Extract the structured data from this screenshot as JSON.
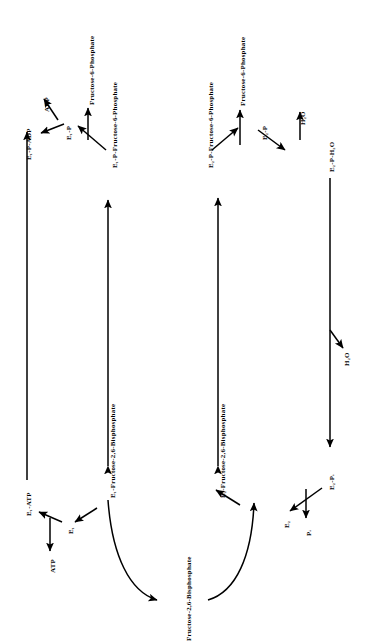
{
  "diagram": {
    "type": "reaction-scheme",
    "orientation": "text-rotated-90-ccw",
    "background_color": "#ffffff",
    "stroke_color": "#000000"
  },
  "nodes": {
    "e1_p_adp": {
      "label": "E₁-P-ADP",
      "branch": "left",
      "role": "complex"
    },
    "adp": {
      "label": "ADP",
      "branch": "left",
      "role": "product"
    },
    "e1_p": {
      "label": "E₁-P",
      "branch": "left",
      "role": "intermediate"
    },
    "fructose_6_phosphate_left": {
      "label": "Fructose-6-Phosphate",
      "branch": "left",
      "role": "substrate"
    },
    "e1_p_f6p": {
      "label": "E₁-P-Fructose-6-Phosphate",
      "branch": "left",
      "role": "complex"
    },
    "e1_atp": {
      "label": "E₁-ATP",
      "branch": "left",
      "role": "complex"
    },
    "atp": {
      "label": "ATP",
      "branch": "left",
      "role": "substrate"
    },
    "e1": {
      "label": "E₁",
      "branch": "left",
      "role": "free-enzyme"
    },
    "e1_fbp": {
      "label": "E₁-Fructose-2,6-Bisphosphate",
      "branch": "left",
      "role": "complex"
    },
    "e2_p_f6p": {
      "label": "E₂-P-Fructose-6-Phosphate",
      "branch": "right",
      "role": "complex"
    },
    "fructose_6_phosphate_right": {
      "label": "Fructose-6-Phosphate",
      "branch": "right",
      "role": "product"
    },
    "e2_p": {
      "label": "E₂-P",
      "branch": "right",
      "role": "intermediate"
    },
    "h2o_top": {
      "label": "H₂O",
      "branch": "right",
      "role": "substrate"
    },
    "e2_p_h2o": {
      "label": "E₂-P-H₂O",
      "branch": "right",
      "role": "complex"
    },
    "h2o_mid": {
      "label": "H₂O",
      "branch": "right",
      "role": "product"
    },
    "e2_pi": {
      "label": "E₂-Pᵢ",
      "branch": "right",
      "role": "complex"
    },
    "pi": {
      "label": "Pᵢ",
      "branch": "right",
      "role": "product"
    },
    "e2": {
      "label": "E₂",
      "branch": "right",
      "role": "free-enzyme"
    },
    "e2_fbp": {
      "label": "E₂-Fructose-2,6-Bisphosphate",
      "branch": "right",
      "role": "complex"
    },
    "fructose_2_6_bisphosphate": {
      "label": "Fructose-2,6-Bisphosphate",
      "branch": "center",
      "role": "shared-metabolite"
    }
  },
  "edges": [
    {
      "from": "e1_p_f6p",
      "to": "e1_p",
      "style": "single-arrow"
    },
    {
      "from": "e1_p",
      "to": "e1_p_adp",
      "style": "single-arrow"
    },
    {
      "from": "e1_p",
      "to": "adp",
      "style": "single-arrow"
    },
    {
      "from": "e1_p",
      "to": "fructose_6_phosphate_left",
      "style": "single-arrow"
    },
    {
      "from": "e1_p_adp",
      "to": "e1_atp",
      "style": "single-arrow"
    },
    {
      "from": "e1_p_f6p",
      "to": "e1_fbp",
      "style": "double-arrow"
    },
    {
      "from": "e1_atp",
      "to": "e1",
      "style": "single-arrow"
    },
    {
      "from": "e1",
      "to": "e1_atp",
      "style": "single-arrow"
    },
    {
      "from": "e1",
      "to": "atp",
      "style": "single-arrow"
    },
    {
      "from": "e1",
      "to": "e1_fbp",
      "style": "single-arrow"
    },
    {
      "from": "e1_fbp",
      "to": "fructose_2_6_bisphosphate",
      "style": "curved-arrow"
    },
    {
      "from": "e2_p_f6p",
      "to": "e2_p",
      "style": "single-arrow"
    },
    {
      "from": "e2_p_f6p",
      "to": "fructose_6_phosphate_right",
      "style": "single-arrow"
    },
    {
      "from": "e2_p",
      "to": "e2_p_f6p",
      "style": "single-arrow"
    },
    {
      "from": "e2_p",
      "to": "e2_p_h2o",
      "style": "single-arrow"
    },
    {
      "from": "h2o_top",
      "to": "e2_p",
      "style": "single-arrow"
    },
    {
      "from": "e2_p_f6p",
      "to": "e2_fbp",
      "style": "double-arrow"
    },
    {
      "from": "e2_p_h2o",
      "to": "e2_pi",
      "style": "single-arrow",
      "releases": "h2o_mid"
    },
    {
      "from": "e2_pi",
      "to": "e2",
      "style": "single-arrow"
    },
    {
      "from": "e2",
      "to": "pi",
      "style": "single-arrow"
    },
    {
      "from": "e2",
      "to": "e2_fbp",
      "style": "single-arrow"
    },
    {
      "from": "fructose_2_6_bisphosphate",
      "to": "e2_fbp",
      "style": "curved-arrow"
    }
  ]
}
